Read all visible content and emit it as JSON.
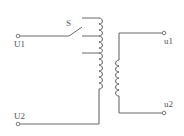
{
  "diagram": {
    "type": "autotransformer-tap-switch-circuit",
    "labels": {
      "switch": "S",
      "primary_input_top": "U1",
      "primary_input_bottom": "U2",
      "secondary_output_top": "u1",
      "secondary_output_bottom": "u2"
    },
    "components": [
      {
        "id": "switch",
        "name": "tap selector switch",
        "label": "S"
      },
      {
        "id": "primary",
        "name": "primary winding",
        "taps": 3
      },
      {
        "id": "secondary",
        "name": "secondary winding"
      }
    ],
    "colors": {
      "line": "#6b6b6b",
      "text": "#555555",
      "background": "#ffffff"
    }
  }
}
